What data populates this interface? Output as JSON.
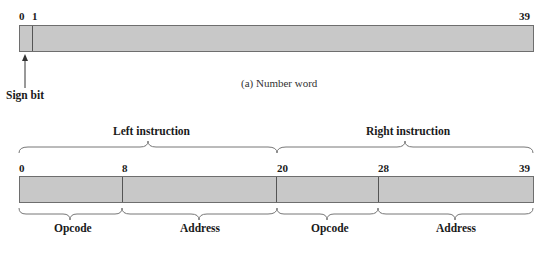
{
  "number_word": {
    "bit_labels": {
      "start": "0",
      "second": "1",
      "end": "39"
    },
    "sign_bit_label": "Sign bit",
    "caption": "(a) Number word"
  },
  "instruction_word": {
    "top_labels": {
      "left": "Left instruction",
      "right": "Right instruction"
    },
    "bit_labels": {
      "b0": "0",
      "b8": "8",
      "b20": "20",
      "b28": "28",
      "b39": "39"
    },
    "field_labels": {
      "opcode_left": "Opcode",
      "address_left": "Address",
      "opcode_right": "Opcode",
      "address_right": "Address"
    }
  },
  "colors": {
    "bar_fill": "#c8c8c8",
    "bar_border": "#6e6e6e",
    "text": "#1a1a1a"
  }
}
